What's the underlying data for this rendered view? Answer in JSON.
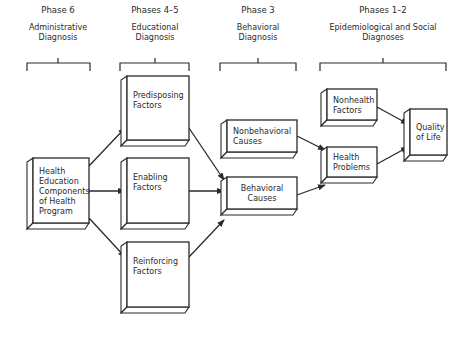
{
  "diagram": {
    "title": "",
    "phases": [
      {
        "id": "phase6",
        "label": "Phase 6",
        "subtitle": [
          "Administrative",
          "Diagnosis"
        ],
        "bracket": {
          "x1": 27,
          "x2": 90,
          "y": 63,
          "tick": 58
        },
        "cx": 58
      },
      {
        "id": "phase45",
        "label": "Phases 4–5",
        "subtitle": [
          "Educational",
          "Diagnosis"
        ],
        "bracket": {
          "x1": 120,
          "x2": 189,
          "y": 63,
          "tick": 155
        },
        "cx": 155
      },
      {
        "id": "phase3",
        "label": "Phase 3",
        "subtitle": [
          "Behavioral",
          "Diagnosis"
        ],
        "bracket": {
          "x1": 220,
          "x2": 296,
          "y": 63,
          "tick": 258
        },
        "cx": 258
      },
      {
        "id": "phase12",
        "label": "Phases 1–2",
        "subtitle": [
          "Epidemiological and Social",
          "Diagnoses"
        ],
        "bracket": {
          "x1": 320,
          "x2": 446,
          "y": 63,
          "tick": 383
        },
        "cx": 383
      }
    ],
    "nodes": [
      {
        "id": "health_ed",
        "lines": [
          "Health",
          "Education",
          "Components",
          "of Health",
          "Program"
        ],
        "x": 33,
        "y": 158,
        "w": 56,
        "h": 65,
        "align": "left"
      },
      {
        "id": "predisposing",
        "lines": [
          "Predisposing",
          "Factors"
        ],
        "x": 127,
        "y": 76,
        "w": 62,
        "h": 64,
        "align": "left"
      },
      {
        "id": "enabling",
        "lines": [
          "Enabling",
          "Factors"
        ],
        "x": 127,
        "y": 158,
        "w": 62,
        "h": 65,
        "align": "left"
      },
      {
        "id": "reinforcing",
        "lines": [
          "Reinforcing",
          "Factors"
        ],
        "x": 127,
        "y": 242,
        "w": 62,
        "h": 65,
        "align": "left"
      },
      {
        "id": "nonbehavioral",
        "lines": [
          "Nonbehavioral",
          "Causes"
        ],
        "x": 227,
        "y": 120,
        "w": 70,
        "h": 32,
        "align": "left"
      },
      {
        "id": "behavioral",
        "lines": [
          "Behavioral",
          "Causes"
        ],
        "x": 227,
        "y": 177,
        "w": 70,
        "h": 32,
        "align": "center"
      },
      {
        "id": "nonhealth",
        "lines": [
          "Nonhealth",
          "Factors"
        ],
        "x": 327,
        "y": 89,
        "w": 50,
        "h": 31,
        "align": "left"
      },
      {
        "id": "health_problems",
        "lines": [
          "Health",
          "Problems"
        ],
        "x": 327,
        "y": 147,
        "w": 50,
        "h": 30,
        "align": "left"
      },
      {
        "id": "quality_of_life",
        "lines": [
          "Quality",
          "of Life"
        ],
        "x": 410,
        "y": 109,
        "w": 37,
        "h": 46,
        "align": "left"
      }
    ],
    "edges": [
      {
        "from": "health_ed",
        "to": "predisposing",
        "x1": 89,
        "y1": 166,
        "x2": 125,
        "y2": 128
      },
      {
        "from": "health_ed",
        "to": "enabling",
        "x1": 89,
        "y1": 191,
        "x2": 125,
        "y2": 191
      },
      {
        "from": "health_ed",
        "to": "reinforcing",
        "x1": 89,
        "y1": 218,
        "x2": 125,
        "y2": 257
      },
      {
        "from": "predisposing",
        "to": "behavioral",
        "x1": 189,
        "y1": 128,
        "x2": 224,
        "y2": 180
      },
      {
        "from": "enabling",
        "to": "behavioral",
        "x1": 189,
        "y1": 191,
        "x2": 224,
        "y2": 191
      },
      {
        "from": "reinforcing",
        "to": "behavioral",
        "x1": 189,
        "y1": 257,
        "x2": 224,
        "y2": 220
      },
      {
        "from": "nonbehavioral",
        "to": "health_problems",
        "x1": 297,
        "y1": 136,
        "x2": 325,
        "y2": 150
      },
      {
        "from": "behavioral",
        "to": "health_problems",
        "x1": 297,
        "y1": 195,
        "x2": 325,
        "y2": 185
      },
      {
        "from": "nonhealth",
        "to": "quality_of_life",
        "x1": 377,
        "y1": 107,
        "x2": 408,
        "y2": 124
      },
      {
        "from": "health_problems",
        "to": "quality_of_life",
        "x1": 377,
        "y1": 164,
        "x2": 408,
        "y2": 147
      }
    ],
    "colors": {
      "ink": "#2a2a2a",
      "background": "#ffffff"
    }
  }
}
